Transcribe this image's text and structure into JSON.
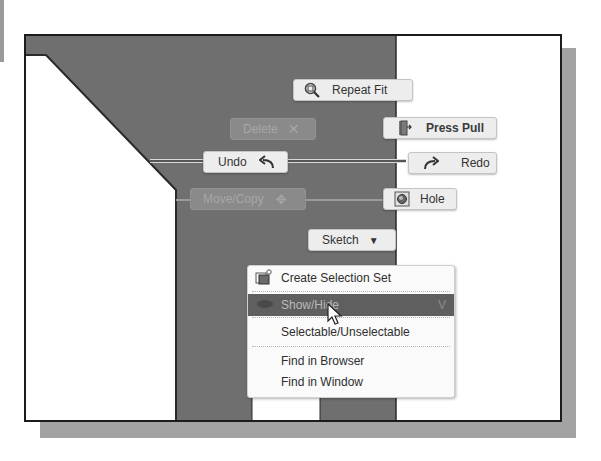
{
  "marking_menu": {
    "repeat_fit": {
      "label": "Repeat Fit",
      "icon": "zoom-fit-icon",
      "enabled": true
    },
    "press_pull": {
      "label": "Press Pull",
      "icon": "press-pull-icon",
      "enabled": true
    },
    "delete": {
      "label": "Delete",
      "icon": "delete-x-icon",
      "enabled": false
    },
    "undo": {
      "label": "Undo",
      "icon": "undo-arrow-icon",
      "enabled": true
    },
    "redo": {
      "label": "Redo",
      "icon": "redo-arrow-icon",
      "enabled": true
    },
    "move_copy": {
      "label": "Move/Copy",
      "icon": "move-arrows-icon",
      "enabled": false
    },
    "hole": {
      "label": "Hole",
      "icon": "hole-icon",
      "enabled": true
    },
    "sketch": {
      "label": "Sketch",
      "icon": "dropdown-triangle-icon",
      "enabled": true
    }
  },
  "context_menu": {
    "items": [
      {
        "label": "Create Selection Set",
        "icon": "selection-set-icon",
        "highlighted": false
      },
      {
        "label": "Show/Hide",
        "icon": "eye-icon",
        "shortcut": "V",
        "highlighted": true
      },
      {
        "label": "Selectable/Unselectable",
        "highlighted": false
      },
      {
        "label": "Find in Browser",
        "highlighted": false
      },
      {
        "label": "Find in Window",
        "highlighted": false
      }
    ]
  },
  "colors": {
    "model_dark": "#6f6f6f",
    "frame_border": "#1c1c1c",
    "shadow": "#a3a3a3",
    "button_bg": "#ededed",
    "highlight_bg": "#5f5f5f"
  }
}
